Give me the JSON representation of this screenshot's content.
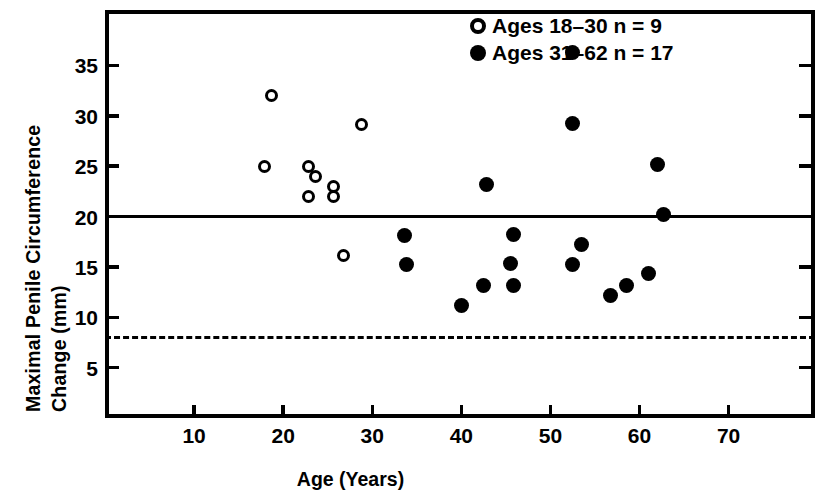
{
  "chart_data": {
    "type": "scatter",
    "title": "",
    "xlabel": "Age (Years)",
    "ylabel_line1": "Maximal Penile Circumference",
    "ylabel_line2": "Change (mm)",
    "xlim": [
      0,
      79.7
    ],
    "ylim": [
      0,
      40.5
    ],
    "xticks": [
      10,
      20,
      30,
      40,
      50,
      60,
      70
    ],
    "yticks": [
      5,
      10,
      15,
      20,
      25,
      30,
      35
    ],
    "grid": false,
    "legend_position": "top-right",
    "reference_lines": [
      {
        "name": "solid-threshold",
        "axis": "y",
        "value": 20,
        "style": "solid"
      },
      {
        "name": "dashed-threshold",
        "axis": "y",
        "value": 8,
        "style": "dashed"
      }
    ],
    "series": [
      {
        "name": "Ages 18-30 n = 9",
        "marker": "open-circle",
        "color": "#000000",
        "n": 9,
        "points": [
          {
            "x": 18.7,
            "y": 32.0
          },
          {
            "x": 17.9,
            "y": 25.0
          },
          {
            "x": 22.8,
            "y": 25.0
          },
          {
            "x": 23.6,
            "y": 24.0
          },
          {
            "x": 22.8,
            "y": 22.0
          },
          {
            "x": 25.7,
            "y": 23.0
          },
          {
            "x": 25.7,
            "y": 22.0
          },
          {
            "x": 28.8,
            "y": 29.1
          },
          {
            "x": 26.8,
            "y": 16.1
          }
        ]
      },
      {
        "name": "Ages 31-62 n = 17",
        "marker": "filled-circle",
        "color": "#000000",
        "n": 17,
        "points": [
          {
            "x": 52.5,
            "y": 36.3
          },
          {
            "x": 52.5,
            "y": 29.2
          },
          {
            "x": 42.8,
            "y": 23.2
          },
          {
            "x": 62.0,
            "y": 25.2
          },
          {
            "x": 62.7,
            "y": 20.2
          },
          {
            "x": 33.6,
            "y": 18.1
          },
          {
            "x": 45.8,
            "y": 18.2
          },
          {
            "x": 53.5,
            "y": 17.2
          },
          {
            "x": 33.8,
            "y": 15.2
          },
          {
            "x": 45.5,
            "y": 15.3
          },
          {
            "x": 52.5,
            "y": 15.2
          },
          {
            "x": 61.0,
            "y": 14.3
          },
          {
            "x": 42.5,
            "y": 13.2
          },
          {
            "x": 45.8,
            "y": 13.2
          },
          {
            "x": 58.5,
            "y": 13.2
          },
          {
            "x": 56.8,
            "y": 12.2
          },
          {
            "x": 40.0,
            "y": 11.2
          }
        ]
      }
    ]
  },
  "legend": {
    "entries": [
      {
        "label": "Ages 18–30 n = 9",
        "marker": "open-circle"
      },
      {
        "label": "Ages 31–62 n = 17",
        "marker": "filled-circle"
      }
    ]
  },
  "axes": {
    "x_title": "Age (Years)",
    "y_title_line1": "Maximal Penile Circumference",
    "y_title_line2": "Change (mm)",
    "x_tick_labels": [
      "10",
      "20",
      "30",
      "40",
      "50",
      "60",
      "70"
    ],
    "y_tick_labels": [
      "35",
      "30",
      "25",
      "20",
      "15",
      "10",
      "5"
    ]
  }
}
